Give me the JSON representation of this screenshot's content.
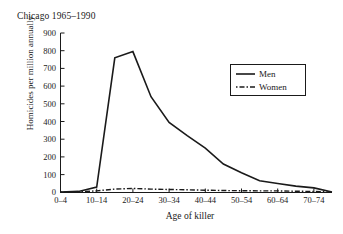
{
  "chart_data": {
    "type": "line",
    "title": "Chicago 1965–1990",
    "xlabel": "Age of killer",
    "ylabel": "Homicides per million annually",
    "grid": false,
    "legend_position": "upper-right",
    "ylim": [
      0,
      900
    ],
    "ytick_labels": [
      "0",
      "100",
      "200",
      "300",
      "400",
      "500",
      "600",
      "700",
      "800",
      "900"
    ],
    "ytick_values": [
      0,
      100,
      200,
      300,
      400,
      500,
      600,
      700,
      800,
      900
    ],
    "categories": [
      "0–4",
      "5–9",
      "10–14",
      "15–19",
      "20–24",
      "25–29",
      "30–34",
      "35–39",
      "40–44",
      "45–49",
      "50–54",
      "55–59",
      "60–64",
      "65–69",
      "70–74",
      "75–79"
    ],
    "xtick_labels_shown": [
      "0–4",
      "10–14",
      "20–24",
      "30–34",
      "40–44",
      "50–54",
      "60–64",
      "70–74"
    ],
    "series": [
      {
        "name": "Men",
        "style": "solid",
        "color": "#1a1a1a",
        "values": [
          2,
          5,
          30,
          760,
          795,
          540,
          395,
          320,
          250,
          160,
          110,
          65,
          50,
          35,
          25,
          2
        ]
      },
      {
        "name": "Women",
        "style": "dash-dot",
        "color": "#1a1a1a",
        "values": [
          1,
          2,
          8,
          18,
          22,
          18,
          16,
          14,
          12,
          10,
          9,
          8,
          8,
          6,
          5,
          1
        ]
      }
    ]
  },
  "legend": {
    "entries": [
      {
        "label": "Men"
      },
      {
        "label": "Women"
      }
    ]
  }
}
